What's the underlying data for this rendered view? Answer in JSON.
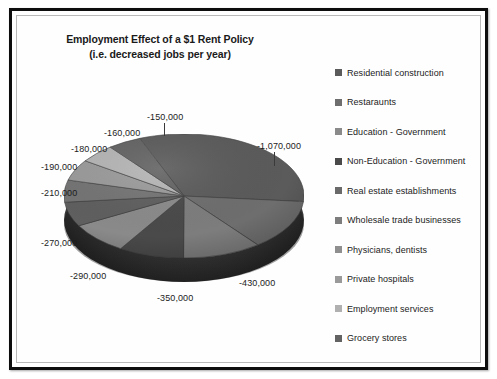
{
  "chart": {
    "title_line1": "Employment Effect of a $1 Rent Policy",
    "title_line2": "(i.e. decreased jobs per year)"
  },
  "chart_data": {
    "type": "pie",
    "title": "Employment Effect of a $1 Rent Policy (i.e. decreased jobs per year)",
    "xlabel": "",
    "ylabel": "",
    "grid": false,
    "legend_position": "right",
    "value_unit": "jobs per year",
    "note": "All values are negative (job losses). Data labels shown around pie perimeter.",
    "total": -3920000,
    "categories": [
      "Residential construction",
      "Restaraunts",
      "Education - Government",
      "Non-Education - Government",
      "Real estate establishments",
      "Wholesale trade businesses",
      "Physicians, dentists",
      "Private hospitals",
      "Employment services",
      "Grocery stores"
    ],
    "values": [
      -1070000,
      -430000,
      -350000,
      -290000,
      -270000,
      -210000,
      -190000,
      -180000,
      -160000,
      -150000
    ],
    "labels": [
      "-1,070,000",
      "-430,000",
      "-350,000",
      "-290,000",
      "-270,000",
      "-210,000",
      "-190,000",
      "-180,000",
      "-160,000",
      "-150,000"
    ],
    "colors": [
      "#5b5b5b",
      "#6e6e6e",
      "#7d7d7d",
      "#4a4a4a",
      "#8a8a8a",
      "#5f5f5f",
      "#747474",
      "#9a9a9a",
      "#b4b4b4",
      "#636363"
    ]
  },
  "legend": {
    "items": [
      {
        "label": "Residential construction",
        "color": "#5b5b5b"
      },
      {
        "label": "Restaraunts",
        "color": "#6e6e6e"
      },
      {
        "label": "Education - Government",
        "color": "#8a8a8a"
      },
      {
        "label": "Non-Education - Government",
        "color": "#4a4a4a"
      },
      {
        "label": "Real estate establishments",
        "color": "#6a6a6a"
      },
      {
        "label": "Wholesale trade businesses",
        "color": "#7d7d7d"
      },
      {
        "label": "Physicians, dentists",
        "color": "#8f8f8f"
      },
      {
        "label": "Private hospitals",
        "color": "#9a9a9a"
      },
      {
        "label": "Employment services",
        "color": "#b0b0b0"
      },
      {
        "label": "Grocery stores",
        "color": "#636363"
      }
    ]
  },
  "data_labels": [
    {
      "text": "-150,000",
      "left": 130,
      "top": 96
    },
    {
      "text": "-160,000",
      "left": 87,
      "top": 112
    },
    {
      "text": "-180,000",
      "left": 54,
      "top": 128
    },
    {
      "text": "-190,000",
      "left": 24,
      "top": 146
    },
    {
      "text": "-210,000",
      "left": 24,
      "top": 172
    },
    {
      "text": "-270,000",
      "left": 24,
      "top": 222
    },
    {
      "text": "-290,000",
      "left": 53,
      "top": 255
    },
    {
      "text": "-350,000",
      "left": 140,
      "top": 277
    },
    {
      "text": "-430,000",
      "left": 222,
      "top": 262
    },
    {
      "text": "-1,070,000",
      "left": 240,
      "top": 125
    }
  ]
}
